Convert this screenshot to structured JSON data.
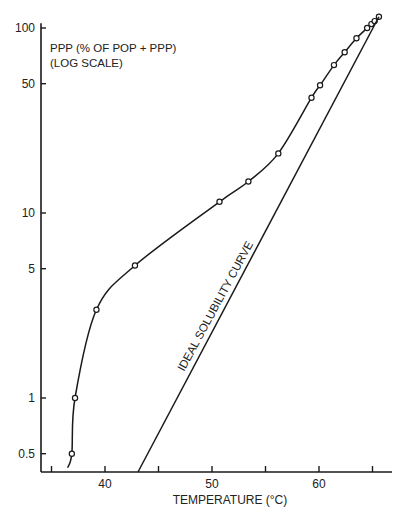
{
  "chart_data": {
    "type": "line",
    "title": "",
    "xlabel": "TEMPERATURE (°C)",
    "ylabel_lines": [
      "PPP (% OF POP + PPP)",
      "(LOG SCALE)"
    ],
    "yscale": "log",
    "xlim": [
      34,
      66.5
    ],
    "ylim": [
      0.4,
      110
    ],
    "x_ticks": [
      35,
      40,
      45,
      50,
      55,
      60,
      65
    ],
    "x_tick_labels": [
      {
        "value": 40,
        "label": "40"
      },
      {
        "value": 50,
        "label": "50"
      },
      {
        "value": 60,
        "label": "60"
      }
    ],
    "y_ticks": [
      {
        "value": 100,
        "label": "100"
      },
      {
        "value": 50,
        "label": "50"
      },
      {
        "value": 10,
        "label": "10"
      },
      {
        "value": 5,
        "label": "5"
      },
      {
        "value": 1,
        "label": "1"
      },
      {
        "value": 0.5,
        "label": "0.5"
      }
    ],
    "grid": false,
    "legend": null,
    "series": [
      {
        "name": "PPP (measured)",
        "style": "smooth line with open circle markers",
        "curve_start": {
          "x": 36.5,
          "y": 0.42
        },
        "points": [
          {
            "x": 36.9,
            "y": 0.5
          },
          {
            "x": 37.2,
            "y": 1.0
          },
          {
            "x": 39.2,
            "y": 3.0
          },
          {
            "x": 42.8,
            "y": 5.2
          },
          {
            "x": 50.7,
            "y": 11.5
          },
          {
            "x": 53.4,
            "y": 14.8
          },
          {
            "x": 56.2,
            "y": 21
          },
          {
            "x": 59.3,
            "y": 42
          },
          {
            "x": 60.1,
            "y": 49
          },
          {
            "x": 61.4,
            "y": 63
          },
          {
            "x": 62.4,
            "y": 74
          },
          {
            "x": 63.5,
            "y": 88
          },
          {
            "x": 64.5,
            "y": 100
          },
          {
            "x": 64.9,
            "y": 105
          },
          {
            "x": 65.2,
            "y": 109
          },
          {
            "x": 65.6,
            "y": 115
          }
        ]
      },
      {
        "name": "IDEAL SOLUBILITY CURVE",
        "style": "straight line, no markers",
        "points": [
          {
            "x": 43.0,
            "y": 0.4
          },
          {
            "x": 65.6,
            "y": 115
          }
        ]
      }
    ],
    "annotations": [
      {
        "text": "IDEAL SOLUBILITY CURVE",
        "rotated_along": "ideal line"
      }
    ]
  }
}
